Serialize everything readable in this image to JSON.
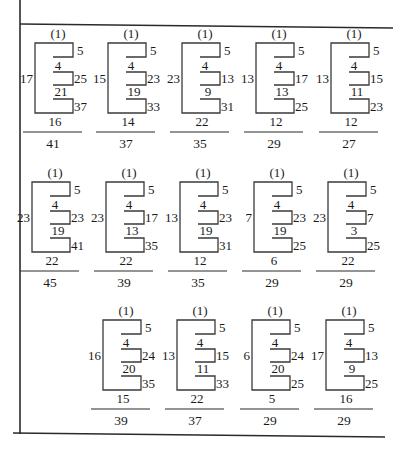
{
  "figure": {
    "top_label": "(1)",
    "rows": [
      {
        "row_index": 1,
        "top_y": 43,
        "items": [
          {
            "left_x": 35,
            "left": "17",
            "right": [
              "5",
              "25",
              "37"
            ],
            "inner": [
              "4",
              "21"
            ],
            "bottom": "16",
            "result": "41"
          },
          {
            "left_x": 108,
            "left": "15",
            "right": [
              "5",
              "23",
              "33"
            ],
            "inner": [
              "4",
              "19"
            ],
            "bottom": "14",
            "result": "37"
          },
          {
            "left_x": 182,
            "left": "23",
            "right": [
              "5",
              "13",
              "31"
            ],
            "inner": [
              "4",
              "9"
            ],
            "bottom": "22",
            "result": "35"
          },
          {
            "left_x": 256,
            "left": "13",
            "right": [
              "5",
              "17",
              "25"
            ],
            "inner": [
              "4",
              "13"
            ],
            "bottom": "12",
            "result": "29"
          },
          {
            "left_x": 331,
            "left": "13",
            "right": [
              "5",
              "15",
              "23"
            ],
            "inner": [
              "4",
              "11"
            ],
            "bottom": "12",
            "result": "27"
          }
        ]
      },
      {
        "row_index": 2,
        "top_y": 182,
        "items": [
          {
            "left_x": 32,
            "left": "23",
            "right": [
              "5",
              "23",
              "41"
            ],
            "inner": [
              "4",
              "19"
            ],
            "bottom": "22",
            "result": "45"
          },
          {
            "left_x": 106,
            "left": "23",
            "right": [
              "5",
              "17",
              "35"
            ],
            "inner": [
              "4",
              "13"
            ],
            "bottom": "22",
            "result": "39"
          },
          {
            "left_x": 180,
            "left": "13",
            "right": [
              "5",
              "23",
              "31"
            ],
            "inner": [
              "4",
              "19"
            ],
            "bottom": "12",
            "result": "35"
          },
          {
            "left_x": 254,
            "left": "7",
            "right": [
              "5",
              "23",
              "25"
            ],
            "inner": [
              "4",
              "19"
            ],
            "bottom": "6",
            "result": "29"
          },
          {
            "left_x": 328,
            "left": "23",
            "right": [
              "5",
              "7",
              "25"
            ],
            "inner": [
              "4",
              "3"
            ],
            "bottom": "22",
            "result": "29"
          }
        ]
      },
      {
        "row_index": 3,
        "top_y": 320,
        "items": [
          {
            "left_x": 103,
            "left": "16",
            "right": [
              "5",
              "24",
              "35"
            ],
            "inner": [
              "4",
              "20"
            ],
            "bottom": "15",
            "result": "39"
          },
          {
            "left_x": 177,
            "left": "13",
            "right": [
              "5",
              "15",
              "33"
            ],
            "inner": [
              "4",
              "11"
            ],
            "bottom": "22",
            "result": "37"
          },
          {
            "left_x": 252,
            "left": "6",
            "right": [
              "5",
              "24",
              "25"
            ],
            "inner": [
              "4",
              "20"
            ],
            "bottom": "5",
            "result": "29"
          },
          {
            "left_x": 326,
            "left": "17",
            "right": [
              "5",
              "13",
              "25"
            ],
            "inner": [
              "4",
              "9"
            ],
            "bottom": "16",
            "result": "29"
          }
        ]
      }
    ]
  }
}
